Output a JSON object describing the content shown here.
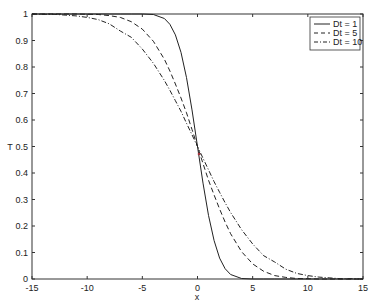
{
  "chart_data": {
    "type": "line",
    "title": "",
    "xlabel": "x",
    "ylabel": "T",
    "xlim": [
      -15,
      15
    ],
    "ylim": [
      0,
      1
    ],
    "xticks": [
      -15,
      -10,
      -5,
      0,
      5,
      10,
      15
    ],
    "xtick_labels": [
      "-15",
      "-10",
      "-5",
      "0",
      "5",
      "10",
      "15"
    ],
    "yticks": [
      0,
      0.1,
      0.2,
      0.3,
      0.4,
      0.5,
      0.6,
      0.7,
      0.8,
      0.9,
      1
    ],
    "ytick_labels": [
      "0",
      "0.1",
      "0.2",
      "0.3",
      "0.4",
      "0.5",
      "0.6",
      "0.7",
      "0.8",
      "0.9",
      "1"
    ],
    "grid": false,
    "legend_position": "upper right",
    "x": [
      -15,
      -14,
      -13,
      -12,
      -11,
      -10,
      -9,
      -8,
      -7,
      -6,
      -5,
      -4,
      -3,
      -2.5,
      -2,
      -1.5,
      -1,
      -0.5,
      0,
      0.5,
      1,
      1.5,
      2,
      2.5,
      3,
      4,
      5,
      6,
      7,
      8,
      9,
      10,
      11,
      12,
      13,
      14,
      15
    ],
    "series": [
      {
        "name": "Dt = 1",
        "style": "solid",
        "values": [
          1,
          1,
          1,
          1,
          1,
          1,
          1,
          1,
          1,
          1,
          1,
          0.998,
          0.983,
          0.961,
          0.921,
          0.855,
          0.76,
          0.638,
          0.5,
          0.362,
          0.24,
          0.145,
          0.079,
          0.039,
          0.017,
          0.002,
          0,
          0,
          0,
          0,
          0,
          0,
          0,
          0,
          0,
          0,
          0
        ]
      },
      {
        "name": "Dt = 5",
        "style": "dashed",
        "values": [
          1,
          1,
          1,
          1,
          1,
          0.999,
          0.998,
          0.994,
          0.987,
          0.971,
          0.943,
          0.897,
          0.829,
          0.785,
          0.736,
          0.683,
          0.627,
          0.564,
          0.5,
          0.436,
          0.373,
          0.317,
          0.264,
          0.215,
          0.171,
          0.103,
          0.057,
          0.029,
          0.013,
          0.006,
          0.002,
          0.001,
          0,
          0,
          0,
          0,
          0
        ]
      },
      {
        "name": "Dt = 10",
        "style": "dash-dot",
        "values": [
          1,
          0.999,
          0.999,
          0.996,
          0.993,
          0.987,
          0.979,
          0.963,
          0.936,
          0.912,
          0.868,
          0.814,
          0.749,
          0.712,
          0.673,
          0.633,
          0.588,
          0.544,
          0.5,
          0.456,
          0.412,
          0.367,
          0.327,
          0.288,
          0.251,
          0.186,
          0.132,
          0.088,
          0.064,
          0.037,
          0.021,
          0.013,
          0.007,
          0.004,
          0.001,
          0.001,
          0
        ]
      }
    ]
  },
  "plot": {
    "xlabel": "x",
    "ylabel": "T"
  },
  "legend": {
    "items": [
      {
        "label": "Dt = 1"
      },
      {
        "label": "Dt = 5"
      },
      {
        "label": "Dt = 10"
      }
    ]
  }
}
